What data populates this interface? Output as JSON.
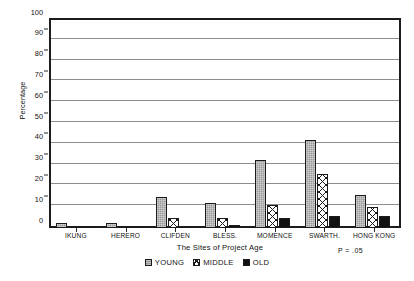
{
  "chart_data": {
    "type": "bar",
    "title": "",
    "xlabel": "The Sites of Project Age",
    "ylabel": "Percentage",
    "ylim": [
      0,
      100
    ],
    "ytick_step": 10,
    "yticks": [
      0,
      10,
      20,
      30,
      40,
      50,
      60,
      70,
      80,
      90,
      100
    ],
    "ytick_labels": [
      "0",
      "10",
      "20",
      "30",
      "40",
      "50",
      "60",
      "70",
      "80",
      "90",
      "100"
    ],
    "grid": "horizontal",
    "legend_position": "bottom-center",
    "categories": [
      "IKUNG",
      "HERERO",
      "CLIFDEN",
      "BLESS.",
      "MOMENCE",
      "SWARTH.",
      "HONG KONG"
    ],
    "series": [
      {
        "name": "YOUNG",
        "fill": "gray-stipple",
        "color": "#9a9a9a",
        "values": [
          2.5,
          2.5,
          15,
          12,
          32.5,
          42.5,
          16
        ]
      },
      {
        "name": "MIDDLE",
        "fill": "crosshatch",
        "color": "#ffffff",
        "values": [
          1,
          0.8,
          5,
          5,
          11,
          26,
          10
        ]
      },
      {
        "name": "OLD",
        "fill": "solid-black",
        "color": "#111111",
        "values": [
          1,
          0.8,
          1,
          1.5,
          5,
          6,
          6
        ]
      }
    ],
    "annotations": [
      {
        "name": "p-value",
        "text": "P = .05"
      }
    ]
  },
  "legend": {
    "items": [
      {
        "label": "YOUNG"
      },
      {
        "label": "MIDDLE"
      },
      {
        "label": "OLD"
      }
    ]
  },
  "notes": {
    "p_value": "P = .05"
  }
}
